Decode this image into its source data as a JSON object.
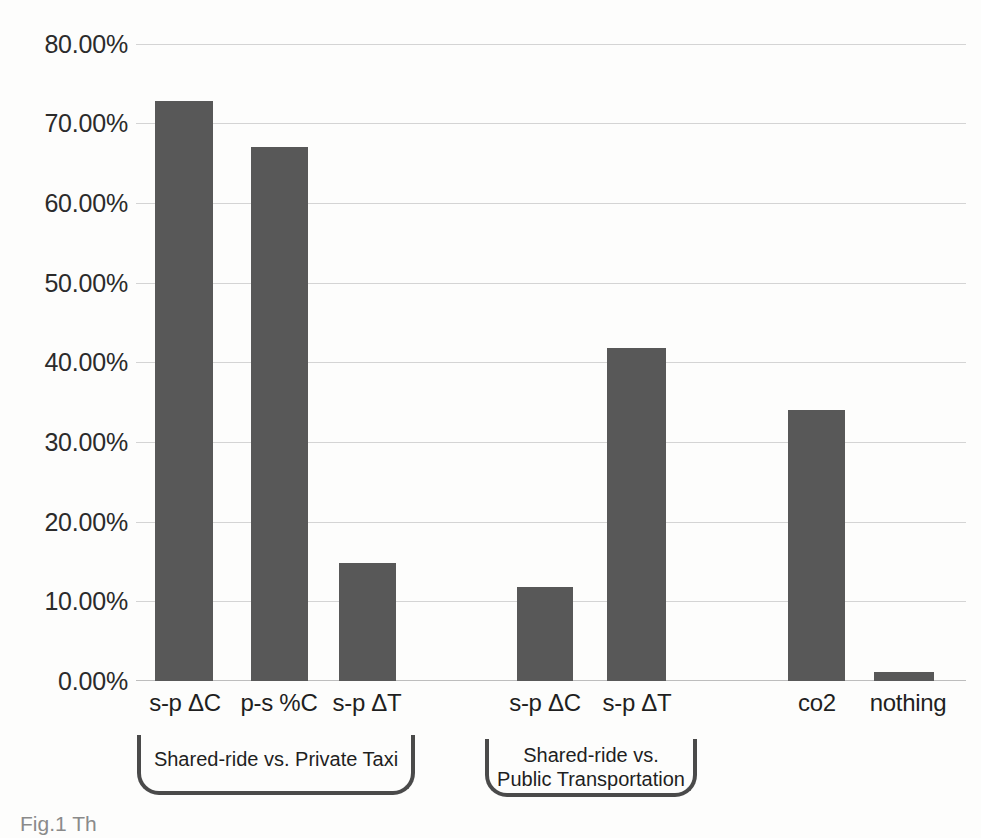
{
  "chart_data": {
    "type": "bar",
    "title": "",
    "xlabel": "",
    "ylabel": "",
    "ylim": [
      0,
      80
    ],
    "ytick_step": 10,
    "ytick_labels": [
      "0.00%",
      "10.00%",
      "20.00%",
      "30.00%",
      "40.00%",
      "50.00%",
      "60.00%",
      "70.00%",
      "80.00%"
    ],
    "ytick_values": [
      0,
      10,
      20,
      30,
      40,
      50,
      60,
      70,
      80
    ],
    "grid": true,
    "legend": "none",
    "categories": [
      "s-p ΔC",
      "p-s %C",
      "s-p ΔT",
      "s-p ΔC",
      "s-p ΔT",
      "co2",
      "nothing"
    ],
    "values": [
      72.9,
      67.1,
      14.8,
      11.8,
      41.8,
      34.0,
      1.1
    ],
    "value_labels": [
      "72.90%",
      "67.10%",
      "14.80%",
      "11.80%",
      "41.80%",
      "34.00%",
      "1.10%"
    ],
    "bar_color": "#585858",
    "grid_color": "#d4d4d4",
    "groups": [
      {
        "label": "Shared-ride vs. Private Taxi",
        "category_indices": [
          0,
          1,
          2
        ]
      },
      {
        "label": "Shared-ride vs.\nPublic Transportation",
        "category_indices": [
          3,
          4
        ]
      }
    ],
    "ungrouped_category_indices": [
      5,
      6
    ]
  },
  "figure": {
    "caption_fragment": "Fig.1  Th"
  }
}
